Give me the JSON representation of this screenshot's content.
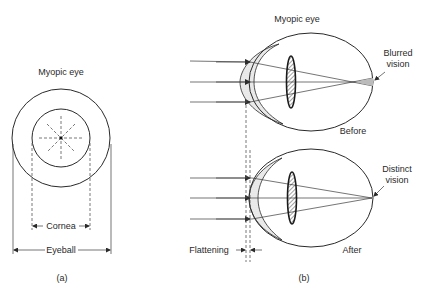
{
  "figure_a": {
    "title": "Myopic eye",
    "cornea_label": "Cornea",
    "eyeball_label": "Eyeball",
    "caption": "(a)"
  },
  "figure_b": {
    "title": "Myopic eye",
    "before": {
      "state_label": "Before",
      "annotation_line1": "Blurred",
      "annotation_line2": "vision"
    },
    "after": {
      "state_label": "After",
      "annotation_line1": "Distinct",
      "annotation_line2": "vision"
    },
    "flattening_label": "Flattening",
    "caption": "(b)"
  },
  "colors": {
    "ink": "#2a2a2a",
    "cornea_fill": "#e4e4e4",
    "background": "#ffffff"
  }
}
